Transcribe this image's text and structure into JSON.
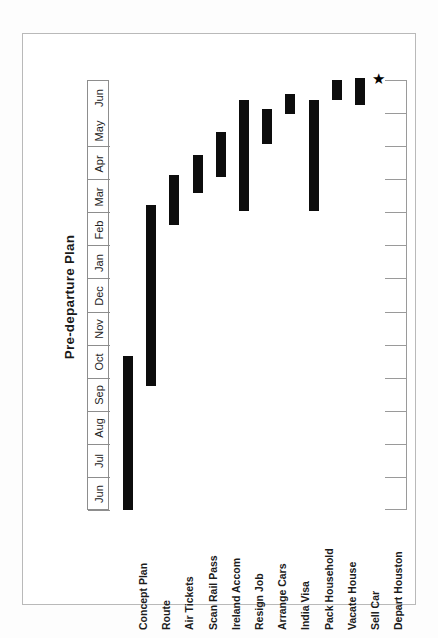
{
  "chart_data": {
    "type": "bar",
    "title": "Pre-departure Plan",
    "xlabel": "",
    "ylabel": "",
    "orientation": "rotated-gantt",
    "grid": true,
    "legend": false,
    "axis_months": [
      "Jun",
      "Jul",
      "Aug",
      "Sep",
      "Oct",
      "Nov",
      "Dec",
      "Jan",
      "Feb",
      "Mar",
      "Apr",
      "May",
      "Jun"
    ],
    "categories": [
      "Concept Plan",
      "Route",
      "Air Tickets",
      "Scan Rail Pass",
      "Ireland Accom",
      "Resign Job",
      "Arrange Cars",
      "India Visa",
      "Pack Household",
      "Vacate House",
      "Sell Car",
      "Depart Houston"
    ],
    "tasks": [
      {
        "name": "Concept Plan",
        "start_month": "Jun",
        "end_month": "Oct",
        "start": 0.0,
        "end": 4.3,
        "milestone": false
      },
      {
        "name": "Route",
        "start_month": "Sep",
        "end_month": "Feb",
        "start": 3.45,
        "end": 8.5,
        "milestone": false
      },
      {
        "name": "Air Tickets",
        "start_month": "Feb",
        "end_month": "Mar",
        "start": 7.95,
        "end": 9.35,
        "milestone": false
      },
      {
        "name": "Scan Rail Pass",
        "start_month": "Mar",
        "end_month": "Mar",
        "start": 8.85,
        "end": 9.9,
        "milestone": false
      },
      {
        "name": "Ireland Accom",
        "start_month": "Mar",
        "end_month": "Apr",
        "start": 9.3,
        "end": 10.55,
        "milestone": false
      },
      {
        "name": "Resign Job",
        "start_month": "Feb",
        "end_month": "May",
        "start": 8.35,
        "end": 11.45,
        "milestone": false
      },
      {
        "name": "Arrange Cars",
        "start_month": "Apr",
        "end_month": "May",
        "start": 10.2,
        "end": 11.2,
        "milestone": false
      },
      {
        "name": "India Visa",
        "start_month": "May",
        "end_month": "May",
        "start": 11.05,
        "end": 11.6,
        "milestone": false
      },
      {
        "name": "Pack Household",
        "start_month": "Feb",
        "end_month": "May",
        "start": 8.35,
        "end": 11.45,
        "milestone": false
      },
      {
        "name": "Vacate House",
        "start_month": "May",
        "end_month": "Jun",
        "start": 11.45,
        "end": 12.0,
        "milestone": false
      },
      {
        "name": "Sell Car",
        "start_month": "May",
        "end_month": "Jun",
        "start": 11.3,
        "end": 12.05,
        "milestone": false
      },
      {
        "name": "Depart Houston",
        "start_month": "Jun",
        "end_month": "Jun",
        "start": 12.05,
        "end": 12.05,
        "milestone": true
      }
    ],
    "milestone_marker": "★"
  }
}
